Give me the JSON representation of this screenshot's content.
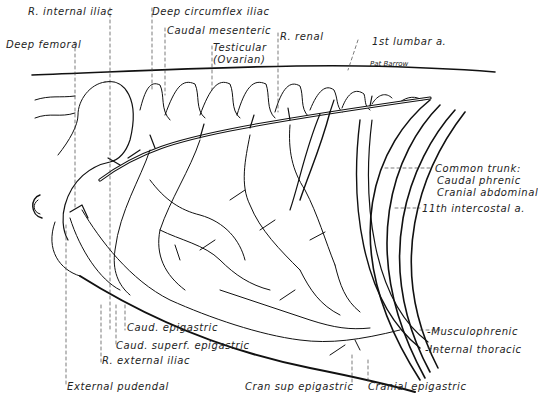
{
  "figure": {
    "signature": "Pat Barrow",
    "colors": {
      "ink": "#111111",
      "background": "#ffffff"
    }
  },
  "labels": {
    "r_internal_iliac": "R. internal iliac",
    "deep_circumflex_iliac": "Deep circumflex iliac",
    "caudal_mesenteric": "Caudal mesenteric",
    "deep_femoral": "Deep femoral",
    "testicular": "Testicular",
    "ovarian": "(Ovarian)",
    "r_renal": "R. renal",
    "first_lumbar": "1st lumbar a.",
    "common_trunk": "Common trunk:",
    "caudal_phrenic": "Caudal phrenic",
    "cranial_abdominal": "Cranial abdominal",
    "eleventh_intercostal": "11th intercostal a.",
    "musculophrenic": "-Musculophrenic",
    "internal_thoracic": "-Internal thoracic",
    "caud_epigastric": "Caud. epigastric",
    "caud_superf_epigastric": "Caud. superf. epigastric",
    "r_external_iliac": "R. external iliac",
    "external_pudendal": "External pudendal",
    "cran_sup_epigastric": "Cran sup epigastric",
    "cranial_epigastric": "Cranial epigastric"
  }
}
